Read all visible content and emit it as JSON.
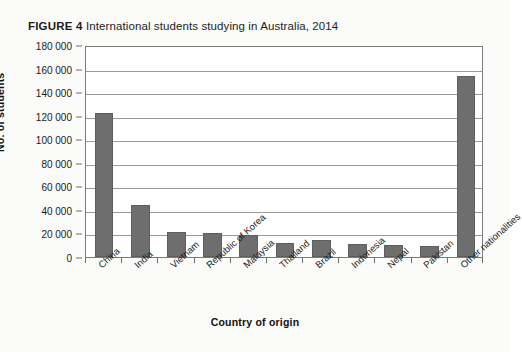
{
  "figure": {
    "label": "FIGURE 4",
    "caption": "International students studying in Australia, 2014"
  },
  "chart_data": {
    "type": "bar",
    "title": "International students studying in Australia, 2014",
    "xlabel": "Country of origin",
    "ylabel": "No. of students",
    "categories": [
      "China",
      "India",
      "Vietnam",
      "Republic of Korea",
      "Malaysia",
      "Thailand",
      "Brazil",
      "Indonesia",
      "Nepal",
      "Pakistan",
      "Other nationalities"
    ],
    "values": [
      122000,
      44000,
      21000,
      20500,
      18500,
      12000,
      14500,
      11000,
      10000,
      9000,
      154000
    ],
    "ylim": [
      0,
      180000
    ],
    "ytick_values": [
      0,
      20000,
      40000,
      60000,
      80000,
      100000,
      120000,
      140000,
      160000,
      180000
    ],
    "ytick_labels": [
      "0",
      "20 000",
      "40 000",
      "60 000",
      "80 000",
      "100 000",
      "120 000",
      "140 000",
      "160 000",
      "180 000"
    ],
    "grid": true,
    "legend": false,
    "bar_color": "#6e6e6e",
    "gridline_color": "#9a9a9a",
    "frame_color": "#7a7a7a"
  }
}
